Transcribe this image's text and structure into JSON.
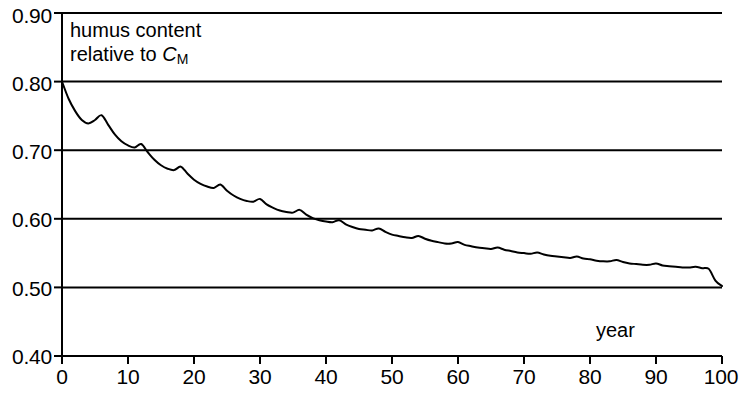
{
  "chart_data": {
    "type": "line",
    "title": "",
    "subtitle": "",
    "xlabel": "year",
    "ylabel": "humus content relative to C_M",
    "ylabel_line1": "humus content",
    "ylabel_line2_prefix": "relative to ",
    "ylabel_line2_symbol": "C",
    "ylabel_line2_subscript": "M",
    "xlim": [
      0,
      100
    ],
    "ylim": [
      0.4,
      0.9
    ],
    "xticks": [
      0,
      10,
      20,
      30,
      40,
      50,
      60,
      70,
      80,
      90,
      100
    ],
    "xtick_labels": [
      "0",
      "10",
      "20",
      "30",
      "40",
      "50",
      "60",
      "70",
      "80",
      "90",
      "100"
    ],
    "yticks": [
      0.4,
      0.5,
      0.6,
      0.7,
      0.8,
      0.9
    ],
    "ytick_labels": [
      "0.40",
      "0.50",
      "0.60",
      "0.70",
      "0.80",
      "0.90"
    ],
    "grid": "horizontal",
    "gridlines_y": [
      0.5,
      0.6,
      0.7,
      0.8,
      0.9
    ],
    "legend": "none",
    "line_color": "#000000",
    "line_width": 2.0,
    "oscillation_period_years": 6,
    "asymptote": 0.5,
    "start_value": 0.8,
    "series": [
      {
        "name": "humus content relative to C_M",
        "x": [
          0,
          1,
          2,
          3,
          4,
          5,
          6,
          7,
          8,
          9,
          10,
          11,
          12,
          13,
          14,
          15,
          16,
          17,
          18,
          19,
          20,
          21,
          22,
          23,
          24,
          25,
          26,
          27,
          28,
          29,
          30,
          31,
          32,
          33,
          34,
          35,
          36,
          37,
          38,
          39,
          40,
          41,
          42,
          43,
          44,
          45,
          46,
          47,
          48,
          49,
          50,
          51,
          52,
          53,
          54,
          55,
          56,
          57,
          58,
          59,
          60,
          61,
          62,
          63,
          64,
          65,
          66,
          67,
          68,
          69,
          70,
          71,
          72,
          73,
          74,
          75,
          76,
          77,
          78,
          79,
          80,
          81,
          82,
          83,
          84,
          85,
          86,
          87,
          88,
          89,
          90,
          91,
          92,
          93,
          94,
          95,
          96,
          97,
          98,
          99,
          100
        ],
        "y": [
          0.8,
          0.775,
          0.757,
          0.744,
          0.739,
          0.744,
          0.751,
          0.737,
          0.723,
          0.713,
          0.707,
          0.704,
          0.709,
          0.697,
          0.686,
          0.678,
          0.673,
          0.671,
          0.676,
          0.666,
          0.657,
          0.651,
          0.647,
          0.645,
          0.65,
          0.641,
          0.634,
          0.629,
          0.626,
          0.625,
          0.629,
          0.621,
          0.616,
          0.612,
          0.61,
          0.609,
          0.613,
          0.606,
          0.601,
          0.598,
          0.596,
          0.595,
          0.598,
          0.592,
          0.588,
          0.585,
          0.584,
          0.583,
          0.586,
          0.581,
          0.577,
          0.575,
          0.573,
          0.572,
          0.575,
          0.571,
          0.568,
          0.566,
          0.564,
          0.564,
          0.566,
          0.562,
          0.56,
          0.558,
          0.557,
          0.556,
          0.558,
          0.555,
          0.553,
          0.551,
          0.55,
          0.549,
          0.551,
          0.548,
          0.546,
          0.545,
          0.544,
          0.543,
          0.545,
          0.542,
          0.541,
          0.539,
          0.538,
          0.538,
          0.54,
          0.537,
          0.535,
          0.534,
          0.533,
          0.533,
          0.535,
          0.532,
          0.531,
          0.53,
          0.529,
          0.529,
          0.53,
          0.528,
          0.527,
          0.51,
          0.502
        ]
      }
    ]
  },
  "axis": {
    "y_label_values": [
      "0.90",
      "0.80",
      "0.70",
      "0.60",
      "0.50",
      "0.40"
    ],
    "x_label_values": [
      "0",
      "10",
      "20",
      "30",
      "40",
      "50",
      "60",
      "70",
      "80",
      "90",
      "100"
    ]
  },
  "annotations": {
    "year_caption": "year"
  }
}
